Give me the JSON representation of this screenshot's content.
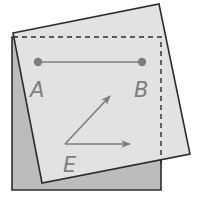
{
  "diagram": {
    "colors": {
      "background": "#ffffff",
      "back_square_fill": "#bcbcbc",
      "front_square_fill": "#e2e2e2",
      "outline": "#2b2b2b",
      "drawing": "#7d7d7d"
    },
    "back_square": {
      "points": "12,37 161,37 161,190 12,190"
    },
    "front_square": {
      "points": "13,33 159,4 190,154 42,183"
    },
    "dashed_outline": {
      "points": "13,37 161,37 161,165"
    },
    "segment_ab": {
      "a": {
        "x": 38,
        "y": 62,
        "label": "A",
        "label_x": 30,
        "label_y": 97
      },
      "b": {
        "x": 142,
        "y": 62,
        "label": "B",
        "label_x": 134,
        "label_y": 97
      }
    },
    "angle_e": {
      "label": "E",
      "vertex": {
        "x": 65,
        "y": 144
      },
      "ray1_end": {
        "x": 110,
        "y": 96
      },
      "ray2_end": {
        "x": 130,
        "y": 144
      },
      "label_x": 63,
      "label_y": 172
    }
  }
}
